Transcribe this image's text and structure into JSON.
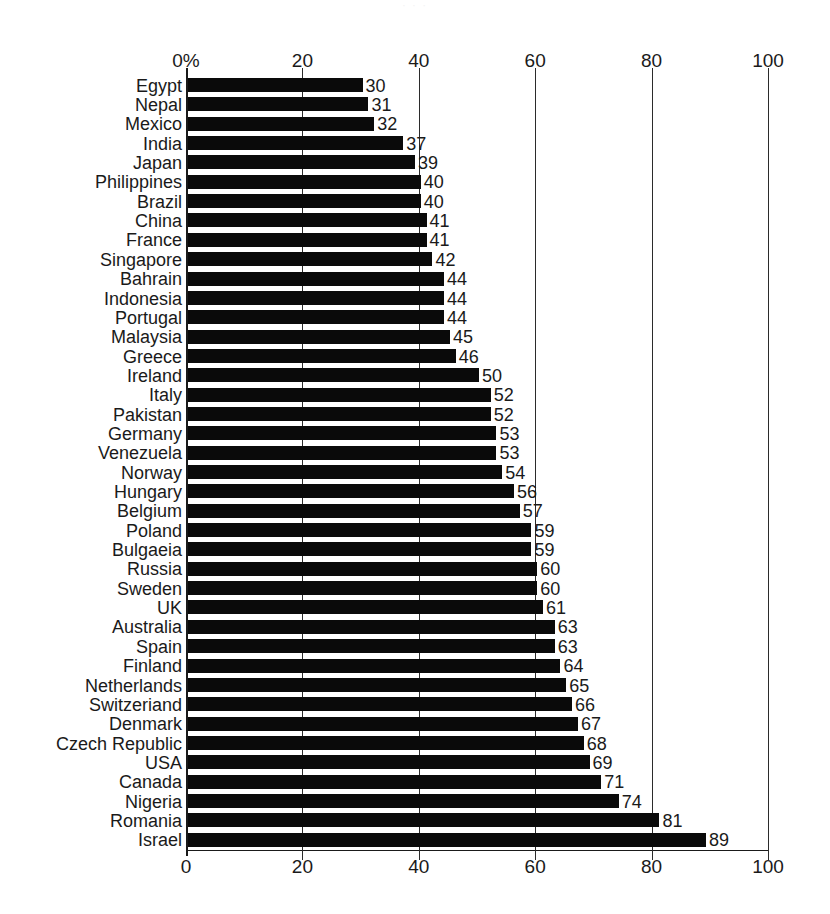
{
  "scan_artifact": {
    "faint_header_text": "· · ·"
  },
  "chart_data": {
    "type": "bar",
    "orientation": "horizontal",
    "title": "",
    "xlabel": "",
    "ylabel": "",
    "xlim": [
      0,
      100
    ],
    "grid": true,
    "legend": false,
    "axis_top_ticks": [
      "0%",
      "20",
      "40",
      "60",
      "80",
      "100"
    ],
    "axis_bottom_ticks": [
      "0",
      "20",
      "40",
      "60",
      "80",
      "100"
    ],
    "tick_values": [
      0,
      20,
      40,
      60,
      80,
      100
    ],
    "value_suffix": "%",
    "bar_color": "#0a0a0a",
    "categories": [
      "Egypt",
      "Nepal",
      "Mexico",
      "India",
      "Japan",
      "Philippines",
      "Brazil",
      "China",
      "France",
      "Singapore",
      "Bahrain",
      "Indonesia",
      "Portugal",
      "Malaysia",
      "Greece",
      "Ireland",
      "Italy",
      "Pakistan",
      "Germany",
      "Venezuela",
      "Norway",
      "Hungary",
      "Belgium",
      "Poland",
      "Bulgaeia",
      "Russia",
      "Sweden",
      "UK",
      "Australia",
      "Spain",
      "Finland",
      "Netherlands",
      "Switzeriand",
      "Denmark",
      "Czech Republic",
      "USA",
      "Canada",
      "Nigeria",
      "Romania",
      "Israel"
    ],
    "values": [
      30,
      31,
      32,
      37,
      39,
      40,
      40,
      41,
      41,
      42,
      44,
      44,
      44,
      45,
      46,
      50,
      52,
      52,
      53,
      53,
      54,
      56,
      57,
      59,
      59,
      60,
      60,
      61,
      63,
      63,
      64,
      65,
      66,
      67,
      68,
      69,
      71,
      74,
      81,
      89
    ]
  }
}
